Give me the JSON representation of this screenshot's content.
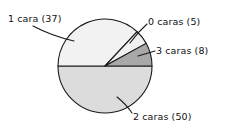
{
  "chart_data": {
    "type": "pie",
    "title": "",
    "subtitle": "",
    "xlabel": "",
    "ylabel": "",
    "legend_position": "none",
    "grid": false,
    "total": 100,
    "units": "recuento",
    "categories": [
      "1 cara",
      "0 caras",
      "3 caras",
      "2 caras"
    ],
    "values": [
      37,
      5,
      8,
      50
    ],
    "labels": [
      "1 cara (37)",
      "0 caras (5)",
      "3 caras (8)",
      "2 caras (50)"
    ],
    "slices": [
      {
        "name": "1 cara",
        "value": 37,
        "label": "1 cara (37)",
        "percent": 37,
        "angle_deg": 133.2,
        "color": "#f2f2f2"
      },
      {
        "name": "0 caras",
        "value": 5,
        "label": "0 caras (5)",
        "percent": 5,
        "angle_deg": 18.0,
        "color": "#f0f0f0"
      },
      {
        "name": "3 caras",
        "value": 8,
        "label": "3 caras (8)",
        "percent": 8,
        "angle_deg": 28.8,
        "color": "#a8a8a8"
      },
      {
        "name": "2 caras",
        "value": 50,
        "label": "2 caras (50)",
        "percent": 50,
        "angle_deg": 180.0,
        "color": "#dcdcdc"
      }
    ],
    "colors": {
      "slice_1_cara": "#f2f2f2",
      "slice_0_caras": "#f0f0f0",
      "slice_3_caras": "#a8a8a8",
      "slice_2_caras": "#dcdcdc",
      "outline": "#1a1a1a",
      "text": "#111111",
      "background": "#ffffff"
    }
  }
}
